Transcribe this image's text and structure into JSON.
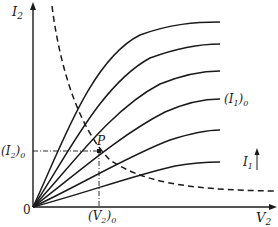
{
  "diagram": {
    "type": "characteristic-curves",
    "axes": {
      "y_label": "I",
      "y_label_sub": "2",
      "x_label": "V",
      "x_label_sub": "2",
      "origin_label": "0"
    },
    "operating_point": {
      "label": "P",
      "i2_label": "(I",
      "i2_sub": "2",
      "i2_tail": ")",
      "i2_tail_sub": "0",
      "v2_label": "(V",
      "v2_sub": "2",
      "v2_tail": ")",
      "v2_tail_sub": "0"
    },
    "curve_label": {
      "text": "(I",
      "sub": "1",
      "tail": ")",
      "tail_sub": "0"
    },
    "parameter_label": {
      "text": "I",
      "sub": "1",
      "direction": "increasing-upward"
    },
    "family_curves": [
      {
        "end_x": 220,
        "end_y": 22
      },
      {
        "end_x": 220,
        "end_y": 44
      },
      {
        "end_x": 220,
        "end_y": 71
      },
      {
        "end_x": 220,
        "end_y": 99,
        "labeled": true
      },
      {
        "end_x": 220,
        "end_y": 130
      },
      {
        "end_x": 220,
        "end_y": 162
      }
    ],
    "load_curve": {
      "style": "dashed",
      "start": [
        52,
        6
      ],
      "end": [
        275,
        191
      ]
    },
    "colors": {
      "ink": "#1a1a1a",
      "background": "#ffffff"
    }
  }
}
